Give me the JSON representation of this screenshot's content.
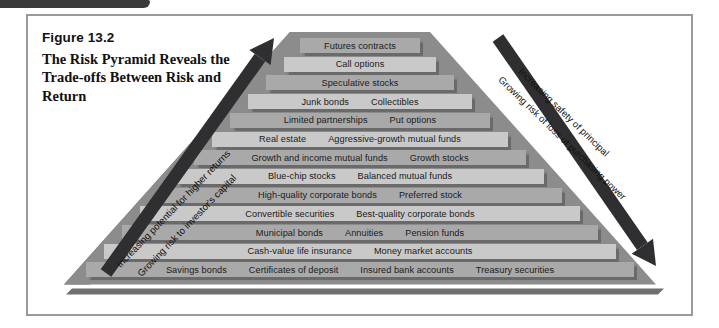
{
  "figure": {
    "number": "Figure 13.2",
    "title": "The Risk Pyramid Reveals the Trade-offs Between Risk and Return"
  },
  "arrows": {
    "left": {
      "label_upper": "Increasing potential for higher returns",
      "label_lower": "Growing risk to investor's capital",
      "direction": "up"
    },
    "right": {
      "label_upper": "Increasing safety of principal",
      "label_lower": "Growing risk of loss of purchasing power",
      "direction": "down"
    }
  },
  "colors": {
    "pyramid_body": "#8c8c8c",
    "pyramid_shadow": "#6a6a6a",
    "row_light": "#c9c9c9",
    "row_mid": "#a9a9a9",
    "arrow": "#2f2f31",
    "frame_border": "#9a9a9a",
    "base_strip": "#6f6f6f"
  },
  "pyramid": {
    "rows": [
      {
        "items": [
          "Futures contracts"
        ],
        "shade": "mid",
        "width": 120,
        "left": 272
      },
      {
        "items": [
          "Call options"
        ],
        "shade": "light",
        "width": 152,
        "left": 256
      },
      {
        "items": [
          "Speculative stocks"
        ],
        "shade": "mid",
        "width": 188,
        "left": 238
      },
      {
        "items": [
          "Junk bonds",
          "Collectibles"
        ],
        "shade": "light",
        "width": 224,
        "left": 220
      },
      {
        "items": [
          "Limited partnerships",
          "Put options"
        ],
        "shade": "mid",
        "width": 260,
        "left": 202
      },
      {
        "items": [
          "Real estate",
          "Aggressive-growth mutual funds"
        ],
        "shade": "light",
        "width": 296,
        "left": 184
      },
      {
        "items": [
          "Growth and income mutual funds",
          "Growth stocks"
        ],
        "shade": "mid",
        "width": 332,
        "left": 166
      },
      {
        "items": [
          "Blue-chip stocks",
          "Balanced mutual funds"
        ],
        "shade": "light",
        "width": 368,
        "left": 148
      },
      {
        "items": [
          "High-quality corporate bonds",
          "Preferred stock"
        ],
        "shade": "mid",
        "width": 404,
        "left": 130
      },
      {
        "items": [
          "Convertible securities",
          "Best-quality corporate bonds"
        ],
        "shade": "light",
        "width": 440,
        "left": 112
      },
      {
        "items": [
          "Municipal bonds",
          "Annuities",
          "Pension funds"
        ],
        "shade": "mid",
        "width": 476,
        "left": 94
      },
      {
        "items": [
          "Cash-value life insurance",
          "Money market accounts"
        ],
        "shade": "light",
        "width": 512,
        "left": 76
      },
      {
        "items": [
          "Savings bonds",
          "Certificates of deposit",
          "Insured bank accounts",
          "Treasury securities"
        ],
        "shade": "mid",
        "width": 548,
        "left": 58
      }
    ]
  }
}
